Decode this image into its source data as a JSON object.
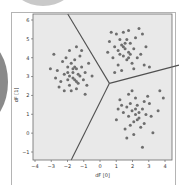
{
  "chart_data": {
    "type": "scatter",
    "title": "",
    "xlabel": "dF [0]",
    "ylabel": "dF [1]",
    "xlim": [
      -4,
      4
    ],
    "ylim": [
      -1.6,
      6.4
    ],
    "xticks": [
      "−4",
      "−3",
      "−2",
      "−1",
      "0",
      "1",
      "2",
      "3",
      "4"
    ],
    "yticks": [
      "−1",
      "0",
      "1",
      "2",
      "3",
      "4",
      "5",
      "6"
    ],
    "grid": false,
    "legend": null,
    "background_color": "#e9e9e9",
    "point_color": "#6e6e6e",
    "boundary_color": "#505050",
    "decision_boundary": {
      "vertex": [
        0.4,
        2.6
      ],
      "rays_to": [
        [
          -2.0,
          6.4
        ],
        [
          -1.8,
          -1.6
        ],
        [
          4.4,
          3.6
        ]
      ]
    },
    "series": [
      {
        "name": "cluster-left",
        "center": [
          -1.7,
          3.2
        ],
        "points": [
          [
            -1.7,
            3.2
          ],
          [
            -1.5,
            3.4
          ],
          [
            -1.9,
            3.0
          ],
          [
            -1.6,
            2.8
          ],
          [
            -2.0,
            3.5
          ],
          [
            -1.3,
            3.0
          ],
          [
            -1.8,
            3.7
          ],
          [
            -1.4,
            2.6
          ],
          [
            -2.2,
            3.1
          ],
          [
            -1.2,
            3.5
          ],
          [
            -1.6,
            3.9
          ],
          [
            -2.4,
            2.7
          ],
          [
            -1.9,
            2.5
          ],
          [
            -1.1,
            2.8
          ],
          [
            -1.5,
            2.3
          ],
          [
            -2.1,
            4.0
          ],
          [
            -2.6,
            3.3
          ],
          [
            -1.0,
            3.2
          ],
          [
            -1.8,
            2.2
          ],
          [
            -1.3,
            4.1
          ],
          [
            -2.3,
            3.8
          ],
          [
            -0.9,
            2.5
          ],
          [
            -1.6,
            3.5
          ],
          [
            -1.7,
            2.9
          ],
          [
            -1.4,
            3.1
          ],
          [
            -2.0,
            2.8
          ],
          [
            -2.8,
            4.2
          ],
          [
            -2.5,
            2.4
          ],
          [
            -0.8,
            3.7
          ],
          [
            -1.2,
            4.4
          ],
          [
            -3.0,
            3.4
          ],
          [
            -2.7,
            2.9
          ],
          [
            -1.5,
            4.6
          ],
          [
            -0.6,
            3.0
          ],
          [
            -2.2,
            2.2
          ],
          [
            -1.9,
            4.4
          ],
          [
            -1.0,
            2.0
          ],
          [
            -1.7,
            3.4
          ],
          [
            -1.5,
            2.7
          ],
          [
            -2.0,
            3.2
          ]
        ]
      },
      {
        "name": "cluster-top",
        "center": [
          1.3,
          4.5
        ],
        "points": [
          [
            1.3,
            4.5
          ],
          [
            1.1,
            4.7
          ],
          [
            1.5,
            4.3
          ],
          [
            0.9,
            4.4
          ],
          [
            1.6,
            4.8
          ],
          [
            1.2,
            4.1
          ],
          [
            1.0,
            5.0
          ],
          [
            1.8,
            4.5
          ],
          [
            0.7,
            4.6
          ],
          [
            1.4,
            3.9
          ],
          [
            1.9,
            5.1
          ],
          [
            0.8,
            5.3
          ],
          [
            1.2,
            5.4
          ],
          [
            2.2,
            4.2
          ],
          [
            0.6,
            4.0
          ],
          [
            1.5,
            5.5
          ],
          [
            2.1,
            5.6
          ],
          [
            0.5,
            5.4
          ],
          [
            1.7,
            3.7
          ],
          [
            0.9,
            3.6
          ],
          [
            2.4,
            3.6
          ],
          [
            2.7,
            3.5
          ],
          [
            0.4,
            4.9
          ],
          [
            1.3,
            4.8
          ],
          [
            1.6,
            4.2
          ],
          [
            2.3,
            5.3
          ],
          [
            1.1,
            3.3
          ],
          [
            0.7,
            3.2
          ],
          [
            2.0,
            4.0
          ],
          [
            1.4,
            5.0
          ],
          [
            0.3,
            4.3
          ],
          [
            2.5,
            4.6
          ],
          [
            1.0,
            4.2
          ],
          [
            1.8,
            3.4
          ],
          [
            1.2,
            4.6
          ],
          [
            1.5,
            4.0
          ]
        ]
      },
      {
        "name": "cluster-bottom-right",
        "center": [
          1.9,
          0.9
        ],
        "points": [
          [
            1.9,
            0.9
          ],
          [
            1.7,
            1.1
          ],
          [
            2.1,
            0.7
          ],
          [
            1.5,
            0.8
          ],
          [
            2.3,
            1.2
          ],
          [
            1.8,
            0.5
          ],
          [
            2.0,
            1.4
          ],
          [
            1.4,
            1.3
          ],
          [
            2.5,
            0.9
          ],
          [
            1.6,
            0.3
          ],
          [
            2.2,
            0.2
          ],
          [
            1.2,
            1.0
          ],
          [
            2.7,
            1.5
          ],
          [
            1.0,
            1.7
          ],
          [
            1.9,
            1.8
          ],
          [
            2.4,
            0.4
          ],
          [
            1.3,
            0.1
          ],
          [
            2.8,
            0.8
          ],
          [
            1.1,
            1.4
          ],
          [
            2.6,
            1.9
          ],
          [
            3.3,
            2.2
          ],
          [
            3.5,
            1.8
          ],
          [
            3.2,
            1.1
          ],
          [
            1.8,
            -0.2
          ],
          [
            1.4,
            -0.4
          ],
          [
            2.9,
            -0.1
          ],
          [
            2.3,
            -0.9
          ],
          [
            1.7,
            2.2
          ],
          [
            0.9,
            1.2
          ],
          [
            2.0,
            0.6
          ],
          [
            1.6,
            1.5
          ],
          [
            2.4,
            1.6
          ],
          [
            2.1,
            1.0
          ],
          [
            1.5,
            2.0
          ],
          [
            0.8,
            0.6
          ],
          [
            1.9,
            1.2
          ]
        ]
      }
    ]
  }
}
